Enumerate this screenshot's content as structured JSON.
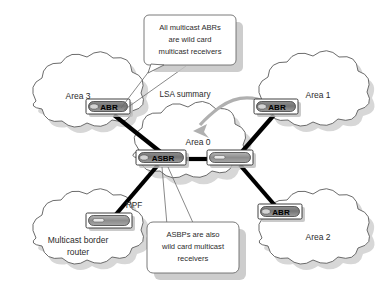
{
  "diagram": {
    "colors": {
      "background": "#ffffff",
      "link": "#000000",
      "cloud_stroke": "#5a5a5a",
      "router_fill_dark": "#707070",
      "router_fill_light": "#a8a8a8",
      "shadow": "#c4c4c4",
      "flow_arrow": "#b0b0b0",
      "text": "#2b2b2b"
    },
    "clouds": [
      {
        "id": "area3",
        "label": "Area 3",
        "cx": 78,
        "cy": 96
      },
      {
        "id": "area1",
        "label": "Area 1",
        "cx": 315,
        "cy": 95
      },
      {
        "id": "area0",
        "label": "Area 0",
        "cx": 196,
        "cy": 143
      },
      {
        "id": "mbr",
        "label_line1": "Multicast border",
        "label_line2": "router",
        "cx": 78,
        "cy": 233
      },
      {
        "id": "area2",
        "label": "Area 2",
        "cx": 316,
        "cy": 233
      }
    ],
    "routers": [
      {
        "id": "abr-area3",
        "label": "ABR",
        "x": 109,
        "y": 108
      },
      {
        "id": "abr-area1",
        "label": "ABR",
        "x": 277,
        "y": 108
      },
      {
        "id": "asbr-area0",
        "label": "ASBR",
        "x": 162,
        "y": 159
      },
      {
        "id": "router-area0",
        "label": "",
        "x": 227,
        "y": 159
      },
      {
        "id": "router-mbr",
        "label": "",
        "x": 106,
        "y": 222
      },
      {
        "id": "abr-area2",
        "label": "ABR",
        "x": 280,
        "y": 212
      }
    ],
    "links": [
      {
        "id": "area3-to-asbr",
        "from": "abr-area3",
        "to": "asbr-area0"
      },
      {
        "id": "asbr-to-core",
        "from": "asbr-area0",
        "to": "router-area0"
      },
      {
        "id": "core-to-area1",
        "from": "router-area0",
        "to": "abr-area1"
      },
      {
        "id": "core-to-area2",
        "from": "router-area0",
        "to": "abr-area2"
      },
      {
        "id": "asbr-to-mbr",
        "from": "asbr-area0",
        "to": "router-mbr",
        "label": "RPF"
      }
    ],
    "callouts": [
      {
        "id": "abr-callout",
        "lines": [
          "All multicast ABRs",
          "are wild card",
          "multicast receivers"
        ],
        "points_to": "abr-area3"
      },
      {
        "id": "asbr-callout",
        "lines": [
          "ASBPs are also",
          "wild card multicast",
          "receivers"
        ],
        "points_to": "asbr-area0"
      }
    ],
    "annotations": [
      {
        "id": "lsa-summary",
        "label": "LSA summary",
        "x": 196,
        "y": 94
      },
      {
        "id": "rpf-label",
        "label": "RPF",
        "x": 134,
        "y": 206
      }
    ]
  }
}
